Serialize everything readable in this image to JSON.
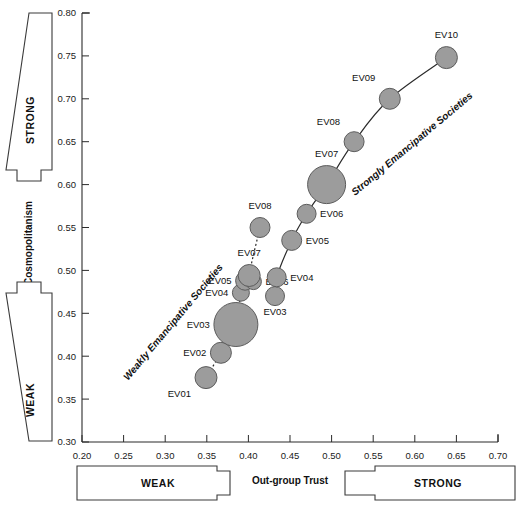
{
  "chart_data": {
    "type": "scatter",
    "title": "",
    "xlabel": "Out-group Trust",
    "ylabel": "Cosmopolitanism",
    "xlim": [
      0.2,
      0.7
    ],
    "ylim": [
      0.3,
      0.8
    ],
    "xticks": [
      "0.20",
      "0.25",
      "0.30",
      "0.35",
      "0.40",
      "0.45",
      "0.50",
      "0.55",
      "0.60",
      "0.65",
      "0.70"
    ],
    "yticks": [
      "0.30",
      "0.35",
      "0.40",
      "0.45",
      "0.50",
      "0.55",
      "0.60",
      "0.65",
      "0.70",
      "0.75",
      "0.80"
    ],
    "grid": false,
    "legend_position": "inline-annotation",
    "bubble_note": "marker area encodes relative group size",
    "series": [
      {
        "name": "Weakly Emancipative Societies",
        "line_style": "dotted",
        "arrow_end": true,
        "points": [
          {
            "label": "EV01",
            "x": 0.349,
            "y": 0.375,
            "size": 11.0,
            "label_pos": "below-left"
          },
          {
            "label": "EV02",
            "x": 0.367,
            "y": 0.404,
            "size": 10.5,
            "label_pos": "left"
          },
          {
            "label": "EV03",
            "x": 0.385,
            "y": 0.437,
            "size": 22.0,
            "label_pos": "left"
          },
          {
            "label": "EV04",
            "x": 0.391,
            "y": 0.474,
            "size": 8.5,
            "label_pos": "left"
          },
          {
            "label": "EV05",
            "x": 0.396,
            "y": 0.488,
            "size": 9.5,
            "label_pos": "left"
          },
          {
            "label": "EV06",
            "x": 0.406,
            "y": 0.487,
            "size": 8.0,
            "label_pos": "right"
          },
          {
            "label": "EV07",
            "x": 0.401,
            "y": 0.494,
            "size": 11.0,
            "label_pos": "above"
          },
          {
            "label": "EV08",
            "x": 0.414,
            "y": 0.55,
            "size": 10.0,
            "label_pos": "above"
          }
        ]
      },
      {
        "name": "Strongly Emancipative Societies",
        "line_style": "solid",
        "arrow_end": true,
        "points": [
          {
            "label": "EV03",
            "x": 0.432,
            "y": 0.47,
            "size": 9.5,
            "label_pos": "below"
          },
          {
            "label": "EV04",
            "x": 0.434,
            "y": 0.492,
            "size": 9.5,
            "label_pos": "right"
          },
          {
            "label": "EV05",
            "x": 0.452,
            "y": 0.535,
            "size": 10.0,
            "label_pos": "right"
          },
          {
            "label": "EV06",
            "x": 0.47,
            "y": 0.566,
            "size": 9.5,
            "label_pos": "right"
          },
          {
            "label": "EV07",
            "x": 0.494,
            "y": 0.6,
            "size": 19.0,
            "label_pos": "above"
          },
          {
            "label": "EV08",
            "x": 0.527,
            "y": 0.65,
            "size": 10.0,
            "label_pos": "above-left"
          },
          {
            "label": "EV09",
            "x": 0.57,
            "y": 0.7,
            "size": 10.5,
            "label_pos": "above-left"
          },
          {
            "label": "EV10",
            "x": 0.638,
            "y": 0.748,
            "size": 11.0,
            "label_pos": "above"
          }
        ]
      }
    ],
    "annotations": [
      {
        "name": "weak-band-label",
        "text": "Weakly Emancipative Societies",
        "rotation": -50
      },
      {
        "name": "strong-band-label",
        "text": "Strongly Emancipative Societies",
        "rotation": -40
      }
    ]
  },
  "axis_arrows": {
    "y_strong": "STRONG",
    "y_weak": "WEAK",
    "x_weak": "WEAK",
    "x_strong": "STRONG"
  },
  "colors": {
    "bubble_fill": "#9c9c9c",
    "bubble_stroke": "#5c5c5c",
    "axis": "#2b2b2b",
    "background": "#ffffff"
  }
}
